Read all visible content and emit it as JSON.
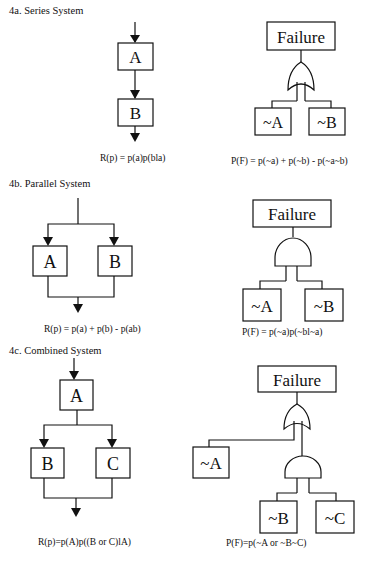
{
  "sections": [
    {
      "id": "4a",
      "title": "4a. Series System",
      "reliability_diagram": {
        "blocks": [
          "A",
          "B"
        ],
        "layout": "series"
      },
      "reliability_equation": "R(p) = p(a)p(bla)",
      "fault_tree": {
        "top_event": "Failure",
        "gate": "OR",
        "inputs": [
          "~A",
          "~B"
        ]
      },
      "failure_equation": "P(F) = p(~a) + p(~b) - p(~a~b)"
    },
    {
      "id": "4b",
      "title": "4b. Parallel System",
      "reliability_diagram": {
        "blocks": [
          "A",
          "B"
        ],
        "layout": "parallel"
      },
      "reliability_equation": "R(p) = p(a) + p(b) - p(ab)",
      "fault_tree": {
        "top_event": "Failure",
        "gate": "AND",
        "inputs": [
          "~A",
          "~B"
        ]
      },
      "failure_equation": "P(F) = p(~a)p(~bl~a)"
    },
    {
      "id": "4c",
      "title": "4c. Combined System",
      "reliability_diagram": {
        "blocks": [
          "A",
          "B",
          "C"
        ],
        "layout": "series-then-parallel"
      },
      "reliability_equation": "R(p)=p(A)p((B or C)lA)",
      "fault_tree": {
        "top_event": "Failure",
        "gate": "OR",
        "inputs": [
          "~A",
          {
            "gate": "AND",
            "inputs": [
              "~B",
              "~C"
            ]
          }
        ]
      },
      "failure_equation": "P(F)=p(~A or ~B~C)"
    }
  ],
  "labels": {
    "a_A": "A",
    "a_B": "B",
    "b_A": "A",
    "b_B": "B",
    "c_A": "A",
    "c_B": "B",
    "c_C": "C",
    "failure": "Failure",
    "notA": "~A",
    "notB": "~B",
    "notC": "~C"
  }
}
